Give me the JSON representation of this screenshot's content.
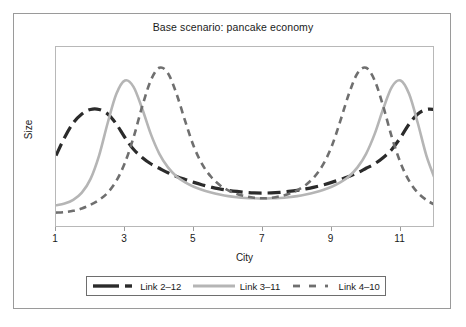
{
  "chart_data": {
    "type": "line",
    "title": "Base scenario: pancake economy",
    "xlabel": "City",
    "ylabel": "Size",
    "xlim": [
      1,
      12
    ],
    "ylim": [
      0,
      1
    ],
    "grid": false,
    "legend_position": "bottom",
    "xticks": [
      "1",
      "3",
      "5",
      "7",
      "9",
      "11"
    ],
    "xtick_values": [
      1,
      3,
      5,
      7,
      9,
      11
    ],
    "yticks": [],
    "x": [
      1,
      1.25,
      1.5,
      1.75,
      2,
      2.25,
      2.5,
      2.75,
      3,
      3.25,
      3.5,
      3.75,
      4,
      4.25,
      4.5,
      4.75,
      5,
      5.25,
      5.5,
      5.75,
      6,
      6.25,
      6.5,
      6.75,
      7,
      7.25,
      7.5,
      7.75,
      8,
      8.25,
      8.5,
      8.75,
      9,
      9.25,
      9.5,
      9.75,
      10,
      10.25,
      10.5,
      10.75,
      11,
      11.25,
      11.5,
      11.75,
      12
    ],
    "series": [
      {
        "name": "Link 2–12",
        "color": "#2b2b2b",
        "style": "long-dash",
        "width": 3.2,
        "values": [
          0.4,
          0.5,
          0.58,
          0.63,
          0.655,
          0.655,
          0.63,
          0.575,
          0.5,
          0.435,
          0.39,
          0.355,
          0.33,
          0.305,
          0.285,
          0.268,
          0.252,
          0.238,
          0.226,
          0.216,
          0.208,
          0.202,
          0.197,
          0.194,
          0.193,
          0.194,
          0.197,
          0.202,
          0.208,
          0.216,
          0.226,
          0.238,
          0.252,
          0.268,
          0.285,
          0.305,
          0.33,
          0.355,
          0.39,
          0.435,
          0.5,
          0.575,
          0.63,
          0.655,
          0.655
        ]
      },
      {
        "name": "Link 3–11",
        "color": "#b5b5b5",
        "style": "solid",
        "width": 2.6,
        "values": [
          0.125,
          0.135,
          0.155,
          0.195,
          0.27,
          0.4,
          0.58,
          0.74,
          0.815,
          0.78,
          0.66,
          0.52,
          0.41,
          0.335,
          0.285,
          0.252,
          0.228,
          0.21,
          0.196,
          0.185,
          0.176,
          0.17,
          0.166,
          0.164,
          0.163,
          0.164,
          0.166,
          0.17,
          0.176,
          0.185,
          0.196,
          0.21,
          0.228,
          0.252,
          0.285,
          0.335,
          0.41,
          0.52,
          0.66,
          0.78,
          0.815,
          0.74,
          0.58,
          0.4,
          0.27
        ]
      },
      {
        "name": "Link 4–10",
        "color": "#6f6f6f",
        "style": "dash",
        "width": 2.6,
        "values": [
          0.085,
          0.088,
          0.095,
          0.108,
          0.128,
          0.155,
          0.195,
          0.26,
          0.36,
          0.5,
          0.67,
          0.815,
          0.885,
          0.855,
          0.74,
          0.59,
          0.45,
          0.35,
          0.283,
          0.238,
          0.208,
          0.188,
          0.175,
          0.167,
          0.164,
          0.167,
          0.175,
          0.188,
          0.208,
          0.238,
          0.283,
          0.35,
          0.45,
          0.59,
          0.74,
          0.855,
          0.885,
          0.815,
          0.67,
          0.5,
          0.36,
          0.26,
          0.195,
          0.155,
          0.128
        ]
      }
    ]
  },
  "legend": {
    "items": [
      {
        "label": "Link 2–12"
      },
      {
        "label": "Link 3–11"
      },
      {
        "label": "Link 4–10"
      }
    ]
  }
}
